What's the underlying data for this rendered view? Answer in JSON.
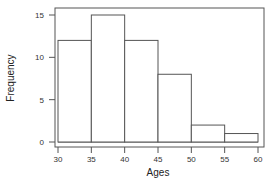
{
  "chart_data": {
    "type": "bar",
    "subtype": "histogram",
    "title": "",
    "xlabel": "Ages",
    "ylabel": "Frequency",
    "bins": [
      [
        30,
        35
      ],
      [
        35,
        40
      ],
      [
        40,
        45
      ],
      [
        45,
        50
      ],
      [
        50,
        55
      ],
      [
        55,
        60
      ]
    ],
    "categories": [
      "30-35",
      "35-40",
      "40-45",
      "45-50",
      "50-55",
      "55-60"
    ],
    "values": [
      12,
      15,
      12,
      8,
      2,
      1
    ],
    "xlim": [
      30,
      60
    ],
    "ylim": [
      0,
      15
    ],
    "xticks": [
      30,
      35,
      40,
      45,
      50,
      55,
      60
    ],
    "yticks": [
      0,
      5,
      10,
      15
    ],
    "grid": false,
    "legend": null,
    "colors": {
      "bar_fill": "#ffffff",
      "bar_edge": "#555555",
      "frame": "#555555"
    }
  },
  "labels": {
    "xlabel": "Ages",
    "ylabel": "Frequency",
    "xticks": [
      "30",
      "35",
      "40",
      "45",
      "50",
      "55",
      "60"
    ],
    "yticks": [
      "0",
      "5",
      "10",
      "15"
    ]
  }
}
